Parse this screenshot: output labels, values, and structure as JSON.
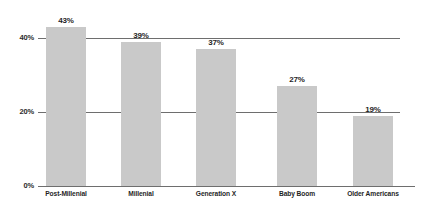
{
  "chart_data": {
    "type": "bar",
    "title": "",
    "subtitle": "",
    "xlabel": "",
    "ylabel": "",
    "ylim": [
      0,
      50
    ],
    "grid": true,
    "legend": "none",
    "orientation": "vertical",
    "categories": [
      "Post-Millenial",
      "Millenial",
      "Generation X",
      "Baby Boom",
      "Older Americans"
    ],
    "values": [
      43,
      39,
      37,
      27,
      19
    ],
    "value_labels": [
      "43%",
      "39%",
      "37%",
      "27%",
      "19%"
    ],
    "y_ticks": [
      0,
      20,
      40
    ],
    "y_tick_labels": [
      "0%",
      "20%",
      "40%"
    ],
    "bar_color": "#c9c9c9",
    "axis_color": "#6e6e6e",
    "text_color": "#1f1f1f"
  },
  "axis": {
    "y_tick_0": "0%",
    "y_tick_20": "20%",
    "y_tick_40": "40%"
  },
  "bars": [
    {
      "category": "Post-Millenial",
      "value": 43,
      "label": "43%"
    },
    {
      "category": "Millenial",
      "value": 39,
      "label": "39%"
    },
    {
      "category": "Generation X",
      "value": 37,
      "label": "37%"
    },
    {
      "category": "Baby Boom",
      "value": 27,
      "label": "27%"
    },
    {
      "category": "Older Americans",
      "value": 19,
      "label": "19%"
    }
  ]
}
